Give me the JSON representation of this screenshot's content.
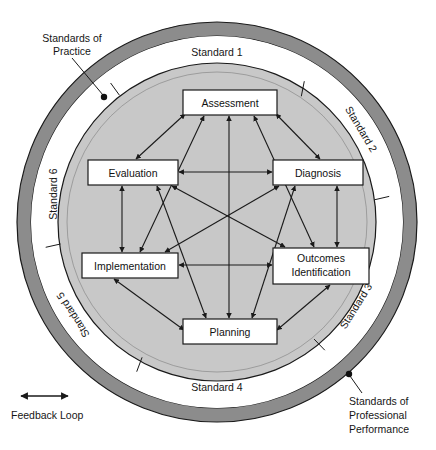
{
  "diagram": {
    "colors": {
      "outer_ring": "#8c8c8c",
      "white_ring": "#ffffff",
      "inner_disc": "#c8c8c8",
      "box_fill": "#ffffff",
      "stroke": "#1a1a1a",
      "text": "#161616"
    },
    "ring_segments": [
      {
        "id": "standard-1",
        "label": "Standard 1",
        "position": "top",
        "angle_deg": -90,
        "flip": false
      },
      {
        "id": "standard-2",
        "label": "Standard 2",
        "position": "upper-right",
        "angle_deg": -30,
        "flip": false
      },
      {
        "id": "standard-3",
        "label": "Standard 3",
        "position": "lower-right",
        "angle_deg": 30,
        "flip": true
      },
      {
        "id": "standard-4",
        "label": "Standard 4",
        "position": "bottom",
        "angle_deg": 90,
        "flip": true
      },
      {
        "id": "standard-5",
        "label": "Standard 5",
        "position": "lower-left",
        "angle_deg": 150,
        "flip": true
      },
      {
        "id": "standard-6",
        "label": "Standard 6",
        "position": "upper-left",
        "angle_deg": 210,
        "flip": false
      }
    ],
    "process_boxes": [
      {
        "id": "assessment",
        "label": "Assessment",
        "lines": [
          "Assessment"
        ],
        "x": 183,
        "y": 90,
        "w": 94,
        "h": 25
      },
      {
        "id": "evaluation",
        "label": "Evaluation",
        "lines": [
          "Evaluation"
        ],
        "x": 88,
        "y": 160,
        "w": 90,
        "h": 25
      },
      {
        "id": "diagnosis",
        "label": "Diagnosis",
        "lines": [
          "Diagnosis"
        ],
        "x": 273,
        "y": 160,
        "w": 90,
        "h": 25
      },
      {
        "id": "implementation",
        "label": "Implementation",
        "lines": [
          "Implementation"
        ],
        "x": 82,
        "y": 253,
        "w": 96,
        "h": 25
      },
      {
        "id": "outcomes-identification",
        "label": "Outcomes Identification",
        "lines": [
          "Outcomes",
          "Identification"
        ],
        "x": 273,
        "y": 248,
        "w": 96,
        "h": 36
      },
      {
        "id": "planning",
        "label": "Planning",
        "lines": [
          "Planning"
        ],
        "x": 183,
        "y": 319,
        "w": 94,
        "h": 25
      }
    ],
    "callouts": [
      {
        "id": "standards-of-practice",
        "lines": [
          "Standards of",
          "Practice"
        ],
        "text_x": 30,
        "text_y": 44,
        "dot_x": 104,
        "dot_y": 97,
        "line_from_x": 74,
        "line_from_y": 62
      },
      {
        "id": "standards-of-professional-performance",
        "lines": [
          "Standards of",
          "Professional",
          "Performance"
        ],
        "text_x": 357,
        "text_y": 404,
        "dot_x": 349,
        "dot_y": 374,
        "line_from_x": 357,
        "line_from_y": 396
      }
    ],
    "legend": {
      "id": "feedback-loop",
      "label": "Feedback Loop",
      "arrow_x1": 18,
      "arrow_x2": 68,
      "arrow_y": 396,
      "text_x": 10,
      "text_y": 417
    },
    "geometry": {
      "cx": 217,
      "cy": 222,
      "outer_ring_outer_r": 200,
      "outer_ring_inner_r": 186,
      "white_ring_inner_r": 160,
      "inner_disc_r": 158,
      "segment_divider_angles_deg": [
        -62,
        -8,
        52,
        118,
        172,
        232
      ]
    },
    "connections": [
      {
        "from": "assessment",
        "to": "evaluation",
        "type": "double"
      },
      {
        "from": "assessment",
        "to": "diagnosis",
        "type": "double"
      },
      {
        "from": "assessment",
        "to": "implementation",
        "type": "double"
      },
      {
        "from": "assessment",
        "to": "outcomes-identification",
        "type": "double"
      },
      {
        "from": "assessment",
        "to": "planning",
        "type": "double"
      },
      {
        "from": "evaluation",
        "to": "diagnosis",
        "type": "double"
      },
      {
        "from": "evaluation",
        "to": "implementation",
        "type": "double"
      },
      {
        "from": "evaluation",
        "to": "outcomes-identification",
        "type": "double"
      },
      {
        "from": "evaluation",
        "to": "planning",
        "type": "double"
      },
      {
        "from": "diagnosis",
        "to": "implementation",
        "type": "double"
      },
      {
        "from": "diagnosis",
        "to": "outcomes-identification",
        "type": "double"
      },
      {
        "from": "diagnosis",
        "to": "planning",
        "type": "double"
      },
      {
        "from": "implementation",
        "to": "outcomes-identification",
        "type": "double"
      },
      {
        "from": "implementation",
        "to": "planning",
        "type": "double"
      },
      {
        "from": "outcomes-identification",
        "to": "planning",
        "type": "double"
      }
    ]
  }
}
